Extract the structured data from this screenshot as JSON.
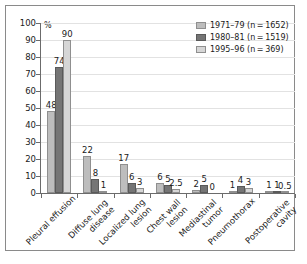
{
  "chart_data": {
    "type": "bar",
    "title": "",
    "xlabel": "",
    "ylabel": "%",
    "unit_label": "%",
    "ylim": [
      0,
      100
    ],
    "yticks": [
      0,
      10,
      20,
      30,
      40,
      50,
      60,
      70,
      80,
      90,
      100
    ],
    "grid": true,
    "legend_position": "top-right",
    "categories": [
      "Pleural effusion",
      "Diffuse lung disease",
      "Localized lung lesion",
      "Chest wall lesion",
      "Mediastinal tumor",
      "Pneumothorax",
      "Postoperative cavity"
    ],
    "category_lines": [
      [
        "Pleural effusion"
      ],
      [
        "Diffuse lung",
        "disease"
      ],
      [
        "Localized lung",
        "lesion"
      ],
      [
        "Chest wall",
        "lesion"
      ],
      [
        "Mediastinal",
        "tumor"
      ],
      [
        "Pneumothorax"
      ],
      [
        "Postoperative",
        "cavity"
      ]
    ],
    "series": [
      {
        "name": "1971–79 (n = 1652)",
        "color": "#bdbdbd",
        "values": [
          48,
          22,
          17,
          6,
          2,
          1,
          1
        ],
        "labels": [
          "48",
          "22",
          "17",
          "6",
          "2",
          "1",
          "1"
        ]
      },
      {
        "name": "1980–81 (n = 1519)",
        "color": "#757575",
        "values": [
          74,
          8,
          6,
          5,
          5,
          4,
          1
        ],
        "labels": [
          "74",
          "8",
          "6",
          "5",
          "5",
          "4",
          "1"
        ]
      },
      {
        "name": "1995–96 (n = 369)",
        "color": "#d6d6d6",
        "values": [
          90,
          1,
          3,
          2.5,
          0,
          3,
          0.5
        ],
        "labels": [
          "90",
          "1",
          "3",
          "2.5",
          "0",
          "3",
          "0.5"
        ]
      }
    ]
  },
  "colors": {
    "series_1": "#bdbdbd",
    "series_2": "#757575",
    "series_3": "#d6d6d6",
    "axis": "#6b6b6b",
    "grid": "#e2e2e2",
    "frame": "#8a8a8a",
    "text": "#1a1a1a"
  }
}
